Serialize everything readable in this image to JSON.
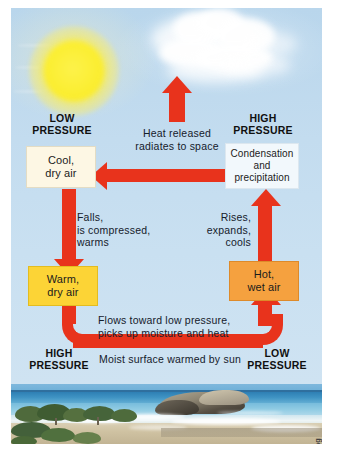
{
  "figure": {
    "credit": "© Cengage Learning",
    "accent_color": "#e8331c",
    "sky_color": "#c3dcef",
    "sun_color": "#fbee32"
  },
  "pressure_labels": {
    "top_left": "LOW\nPRESSURE",
    "top_left_line1": "LOW",
    "top_left_line2": "PRESSURE",
    "top_right_line1": "HIGH",
    "top_right_line2": "PRESSURE",
    "bottom_left_line1": "HIGH",
    "bottom_left_line2": "PRESSURE",
    "bottom_right_line1": "LOW",
    "bottom_right_line2": "PRESSURE"
  },
  "boxes": {
    "cool_dry_air": {
      "line1": "Cool,",
      "line2": "dry air",
      "color": "#fdf7e4"
    },
    "condensation": {
      "line1": "Condensation",
      "line2": "and",
      "line3": "precipitation",
      "color": "#f2f8fc"
    },
    "warm_dry_air": {
      "line1": "Warm,",
      "line2": "dry air",
      "color": "#fcd436"
    },
    "hot_wet_air": {
      "line1": "Hot,",
      "line2": "wet air",
      "color": "#f5a13f"
    }
  },
  "annotations": {
    "heat_released": {
      "line1": "Heat released",
      "line2": "radiates to space"
    },
    "falls": {
      "line1": "Falls,",
      "line2": "is compressed,",
      "line3": "warms"
    },
    "rises": {
      "line1": "Rises,",
      "line2": "expands,",
      "line3": "cools"
    },
    "flows": {
      "line1": "Flows toward low pressure,",
      "line2": "picks up moisture and heat"
    },
    "moist_surface": "Moist surface warmed by sun"
  },
  "photo": {
    "caption": "Coastal beach with sea, rock outcrop, sand and shrubs"
  }
}
